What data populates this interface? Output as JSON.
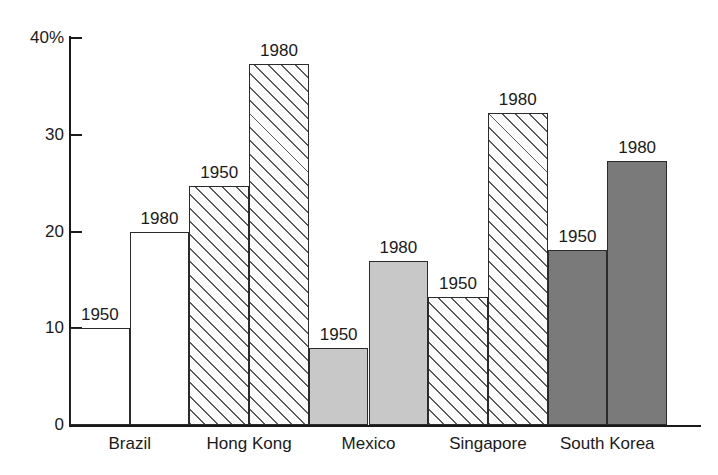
{
  "chart_data": {
    "type": "bar",
    "title": "",
    "xlabel": "",
    "ylabel": "",
    "ylim": [
      0,
      42
    ],
    "yticks": [
      0,
      10,
      20,
      30,
      40
    ],
    "ytick_labels": [
      "0",
      "10",
      "20",
      "30",
      "40%"
    ],
    "grid": false,
    "legend": "none",
    "categories": [
      "Brazil",
      "Hong Kong",
      "Mexico",
      "Singapore",
      "South Korea"
    ],
    "series": [
      {
        "name": "1950",
        "values": [
          10.0,
          24.7,
          8.0,
          13.2,
          18.1
        ]
      },
      {
        "name": "1980",
        "values": [
          20.0,
          37.3,
          17.0,
          32.2,
          27.3
        ]
      }
    ],
    "bar_styles": {
      "Brazil": "white",
      "Hong Kong": "hatch",
      "Mexico": "light-gray",
      "Singapore": "hatch",
      "South Korea": "dark-gray"
    },
    "annotations": [
      {
        "text": "1950",
        "category": "Brazil",
        "value": 10.0
      },
      {
        "text": "1980",
        "category": "Brazil",
        "value": 20.0
      },
      {
        "text": "1950",
        "category": "Hong Kong",
        "value": 24.7
      },
      {
        "text": "1980",
        "category": "Hong Kong",
        "value": 37.3
      },
      {
        "text": "1950",
        "category": "Mexico",
        "value": 8.0
      },
      {
        "text": "1980",
        "category": "Mexico",
        "value": 17.0
      },
      {
        "text": "1950",
        "category": "Singapore",
        "value": 13.2
      },
      {
        "text": "1980",
        "category": "Singapore",
        "value": 32.2
      },
      {
        "text": "1950",
        "category": "South Korea",
        "value": 18.1
      },
      {
        "text": "1980",
        "category": "South Korea",
        "value": 27.3
      }
    ],
    "colors": {
      "white": "#ffffff",
      "light-gray": "#c8c8c8",
      "dark-gray": "#7a7a7a",
      "outline": "#2b2b2b",
      "axis": "#1a1a1a"
    }
  },
  "axis": {
    "y_labels": [
      "40%",
      "30",
      "20",
      "10",
      "0"
    ]
  }
}
